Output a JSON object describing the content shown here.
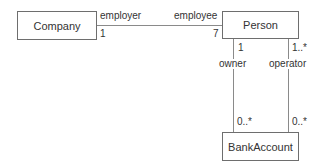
{
  "diagram": {
    "type": "UML class diagram",
    "classes": [
      {
        "id": "company",
        "name": "Company"
      },
      {
        "id": "person",
        "name": "Person"
      },
      {
        "id": "bankaccount",
        "name": "BankAccount"
      }
    ],
    "associations": [
      {
        "from": "Company",
        "to": "Person",
        "from_role": "employer",
        "from_multiplicity": "1",
        "to_role": "employee",
        "to_multiplicity": "7"
      },
      {
        "from": "Person",
        "to": "BankAccount",
        "from_role": "owner",
        "from_multiplicity": "1",
        "to_multiplicity": "0..*"
      },
      {
        "from": "Person",
        "to": "BankAccount",
        "from_role": "operator",
        "from_multiplicity": "1..*",
        "to_multiplicity": "0..*"
      }
    ]
  },
  "labels": {
    "company": "Company",
    "person": "Person",
    "bankaccount": "BankAccount",
    "employer": "employer",
    "employer_mult": "1",
    "employee": "employee",
    "employee_mult": "7",
    "owner": "owner",
    "owner_mult": "1",
    "owner_account_mult": "0..*",
    "operator": "operator",
    "operator_mult": "1..*",
    "operator_account_mult": "0..*"
  }
}
